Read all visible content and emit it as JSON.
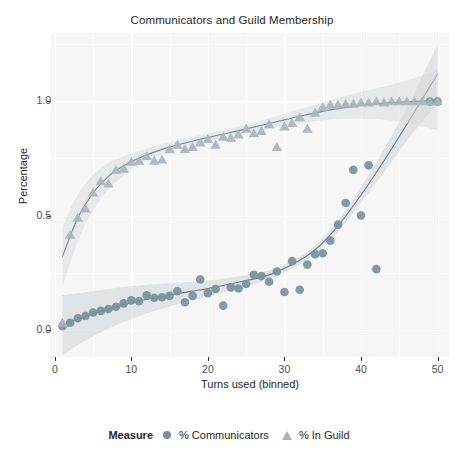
{
  "chart_data": {
    "type": "scatter",
    "title": "Communicators and Guild Membership",
    "xlabel": "Turns used (binned)",
    "ylabel": "Percentage",
    "xlim": [
      -0.5,
      51.5
    ],
    "ylim": [
      -0.12,
      1.3
    ],
    "xticks": [
      0,
      10,
      20,
      30,
      40,
      50
    ],
    "xtick_labels": [
      "0",
      "10",
      "20",
      "30",
      "40",
      "50"
    ],
    "yticks": [
      0.0,
      0.5,
      1.0
    ],
    "ytick_labels": [
      "0.0",
      "0.5",
      "1.0"
    ],
    "grid": true,
    "grid_color": "#ffffff",
    "panel_color": "#f6f6f6",
    "legend": {
      "title": "Measure",
      "position": "bottom",
      "entries": [
        {
          "label": "% Communicators",
          "marker": "circle",
          "color": "#78909c"
        },
        {
          "label": "% In Guild",
          "marker": "triangle",
          "color": "#aab4b8"
        }
      ]
    },
    "series": [
      {
        "name": "% Communicators",
        "marker": "circle",
        "color": "#78909c",
        "fit_line_color": "#5a6a73",
        "ribbon_color": "#c9d2d7",
        "points": [
          {
            "x": 1,
            "y": 0.015
          },
          {
            "x": 2,
            "y": 0.03
          },
          {
            "x": 3,
            "y": 0.05
          },
          {
            "x": 4,
            "y": 0.06
          },
          {
            "x": 5,
            "y": 0.075
          },
          {
            "x": 6,
            "y": 0.082
          },
          {
            "x": 7,
            "y": 0.09
          },
          {
            "x": 8,
            "y": 0.1
          },
          {
            "x": 9,
            "y": 0.115
          },
          {
            "x": 10,
            "y": 0.128
          },
          {
            "x": 11,
            "y": 0.125
          },
          {
            "x": 12,
            "y": 0.15
          },
          {
            "x": 13,
            "y": 0.14
          },
          {
            "x": 14,
            "y": 0.142
          },
          {
            "x": 15,
            "y": 0.148
          },
          {
            "x": 16,
            "y": 0.168
          },
          {
            "x": 17,
            "y": 0.12
          },
          {
            "x": 18,
            "y": 0.148
          },
          {
            "x": 19,
            "y": 0.22
          },
          {
            "x": 20,
            "y": 0.16
          },
          {
            "x": 21,
            "y": 0.178
          },
          {
            "x": 22,
            "y": 0.105
          },
          {
            "x": 23,
            "y": 0.185
          },
          {
            "x": 24,
            "y": 0.18
          },
          {
            "x": 25,
            "y": 0.2
          },
          {
            "x": 26,
            "y": 0.24
          },
          {
            "x": 27,
            "y": 0.235
          },
          {
            "x": 28,
            "y": 0.21
          },
          {
            "x": 29,
            "y": 0.255
          },
          {
            "x": 30,
            "y": 0.165
          },
          {
            "x": 31,
            "y": 0.3
          },
          {
            "x": 32,
            "y": 0.175
          },
          {
            "x": 33,
            "y": 0.285
          },
          {
            "x": 34,
            "y": 0.33
          },
          {
            "x": 35,
            "y": 0.335
          },
          {
            "x": 36,
            "y": 0.39
          },
          {
            "x": 37,
            "y": 0.46
          },
          {
            "x": 38,
            "y": 0.555
          },
          {
            "x": 39,
            "y": 0.7
          },
          {
            "x": 40,
            "y": 0.5
          },
          {
            "x": 41,
            "y": 0.72
          },
          {
            "x": 42,
            "y": 0.265
          },
          {
            "x": 49,
            "y": 1.0
          },
          {
            "x": 50,
            "y": 1.0
          }
        ],
        "fit": [
          {
            "x": 1,
            "y": 0.02
          },
          {
            "x": 5,
            "y": 0.07
          },
          {
            "x": 10,
            "y": 0.118
          },
          {
            "x": 15,
            "y": 0.152
          },
          {
            "x": 20,
            "y": 0.18
          },
          {
            "x": 25,
            "y": 0.215
          },
          {
            "x": 28,
            "y": 0.24
          },
          {
            "x": 31,
            "y": 0.285
          },
          {
            "x": 34,
            "y": 0.35
          },
          {
            "x": 37,
            "y": 0.455
          },
          {
            "x": 40,
            "y": 0.59
          },
          {
            "x": 43,
            "y": 0.74
          },
          {
            "x": 46,
            "y": 0.9
          },
          {
            "x": 48,
            "y": 1.01
          },
          {
            "x": 50,
            "y": 1.12
          }
        ]
      },
      {
        "name": "% In Guild",
        "marker": "triangle",
        "color": "#aab4b8",
        "fit_line_color": "#6b7478",
        "ribbon_color": "#d6dade",
        "points": [
          {
            "x": 1,
            "y": 0.03
          },
          {
            "x": 2,
            "y": 0.415
          },
          {
            "x": 3,
            "y": 0.49
          },
          {
            "x": 4,
            "y": 0.53
          },
          {
            "x": 5,
            "y": 0.6
          },
          {
            "x": 6,
            "y": 0.65
          },
          {
            "x": 7,
            "y": 0.64
          },
          {
            "x": 8,
            "y": 0.7
          },
          {
            "x": 9,
            "y": 0.705
          },
          {
            "x": 10,
            "y": 0.735
          },
          {
            "x": 11,
            "y": 0.74
          },
          {
            "x": 12,
            "y": 0.76
          },
          {
            "x": 13,
            "y": 0.74
          },
          {
            "x": 14,
            "y": 0.745
          },
          {
            "x": 15,
            "y": 0.79
          },
          {
            "x": 16,
            "y": 0.81
          },
          {
            "x": 17,
            "y": 0.79
          },
          {
            "x": 18,
            "y": 0.8
          },
          {
            "x": 19,
            "y": 0.82
          },
          {
            "x": 20,
            "y": 0.835
          },
          {
            "x": 21,
            "y": 0.81
          },
          {
            "x": 22,
            "y": 0.845
          },
          {
            "x": 23,
            "y": 0.84
          },
          {
            "x": 24,
            "y": 0.855
          },
          {
            "x": 25,
            "y": 0.88
          },
          {
            "x": 26,
            "y": 0.86
          },
          {
            "x": 27,
            "y": 0.87
          },
          {
            "x": 28,
            "y": 0.9
          },
          {
            "x": 29,
            "y": 0.8
          },
          {
            "x": 30,
            "y": 0.89
          },
          {
            "x": 31,
            "y": 0.905
          },
          {
            "x": 32,
            "y": 0.93
          },
          {
            "x": 33,
            "y": 0.88
          },
          {
            "x": 34,
            "y": 0.95
          },
          {
            "x": 35,
            "y": 0.975
          },
          {
            "x": 36,
            "y": 0.985
          },
          {
            "x": 37,
            "y": 0.985
          },
          {
            "x": 38,
            "y": 0.99
          },
          {
            "x": 39,
            "y": 0.99
          },
          {
            "x": 40,
            "y": 0.995
          },
          {
            "x": 41,
            "y": 0.995
          },
          {
            "x": 42,
            "y": 1.0
          },
          {
            "x": 43,
            "y": 0.995
          },
          {
            "x": 44,
            "y": 1.0
          },
          {
            "x": 45,
            "y": 1.0
          },
          {
            "x": 46,
            "y": 1.0
          },
          {
            "x": 47,
            "y": 1.0
          },
          {
            "x": 48,
            "y": 1.0
          },
          {
            "x": 49,
            "y": 1.0
          },
          {
            "x": 50,
            "y": 1.0
          }
        ],
        "fit": [
          {
            "x": 1,
            "y": 0.32
          },
          {
            "x": 3,
            "y": 0.49
          },
          {
            "x": 5,
            "y": 0.6
          },
          {
            "x": 7,
            "y": 0.672
          },
          {
            "x": 9,
            "y": 0.718
          },
          {
            "x": 11,
            "y": 0.752
          },
          {
            "x": 14,
            "y": 0.79
          },
          {
            "x": 17,
            "y": 0.818
          },
          {
            "x": 20,
            "y": 0.842
          },
          {
            "x": 24,
            "y": 0.872
          },
          {
            "x": 28,
            "y": 0.903
          },
          {
            "x": 32,
            "y": 0.935
          },
          {
            "x": 36,
            "y": 0.963
          },
          {
            "x": 40,
            "y": 0.983
          },
          {
            "x": 44,
            "y": 0.995
          },
          {
            "x": 47,
            "y": 1.0
          },
          {
            "x": 50,
            "y": 1.005
          }
        ]
      }
    ]
  }
}
